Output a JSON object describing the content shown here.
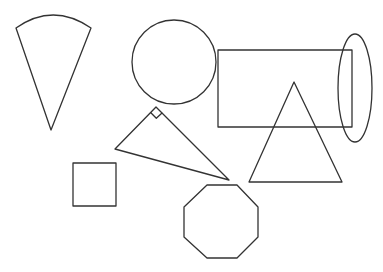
{
  "diagram": {
    "title": "",
    "background": "#ffffff",
    "stroke_color": "#333333",
    "shapes": [
      {
        "id": "sector",
        "type": "circular-sector",
        "tip": [
          51,
          130
        ],
        "left": [
          16,
          28
        ],
        "right": [
          91,
          28
        ],
        "arc_top_y": 15
      },
      {
        "id": "circle",
        "type": "circle",
        "cx": 174,
        "cy": 62,
        "r": 42
      },
      {
        "id": "rectangle",
        "type": "rectangle",
        "x": 218,
        "y": 50,
        "width": 134,
        "height": 77
      },
      {
        "id": "ellipse",
        "type": "ellipse",
        "cx": 355,
        "cy": 88,
        "rx": 17,
        "ry": 54
      },
      {
        "id": "isosceles-triangle",
        "type": "triangle",
        "points": [
          [
            294,
            82
          ],
          [
            249,
            182
          ],
          [
            342,
            182
          ]
        ]
      },
      {
        "id": "right-triangle",
        "type": "right-triangle",
        "points": [
          [
            156,
            107
          ],
          [
            115,
            149
          ],
          [
            229,
            180
          ]
        ],
        "right_angle_at": [
          156,
          107
        ]
      },
      {
        "id": "square",
        "type": "square",
        "x": 73,
        "y": 163,
        "size": 43
      },
      {
        "id": "octagon",
        "type": "octagon",
        "points": [
          [
            207,
            185
          ],
          [
            237,
            185
          ],
          [
            258,
            207
          ],
          [
            258,
            237
          ],
          [
            237,
            258
          ],
          [
            207,
            258
          ],
          [
            184,
            237
          ],
          [
            184,
            207
          ]
        ]
      }
    ]
  }
}
